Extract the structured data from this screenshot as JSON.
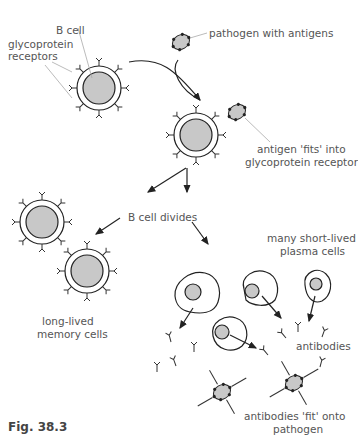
{
  "diagram": {
    "labels": {
      "b_cell": "B cell",
      "receptors_line1": "glycoprotein",
      "receptors_line2": "receptors",
      "pathogen": "pathogen with antigens",
      "fits_line1": "antigen 'fits' into",
      "fits_line2": "glycoprotein receptor",
      "divides": "B cell divides",
      "plasma_line1": "many short-lived",
      "plasma_line2": "plasma cells",
      "memory_line1": "long-lived",
      "memory_line2": "memory cells",
      "antibodies": "antibodies",
      "ab_fit_line1": "antibodies 'fit' onto",
      "ab_fit_line2": "pathogen"
    },
    "caption": "Fig. 38.3",
    "colors": {
      "nucleus_fill": "#c8c8c8",
      "line": "#222222",
      "label_text": "#555555",
      "pointer_line": "#aaaaaa"
    }
  }
}
